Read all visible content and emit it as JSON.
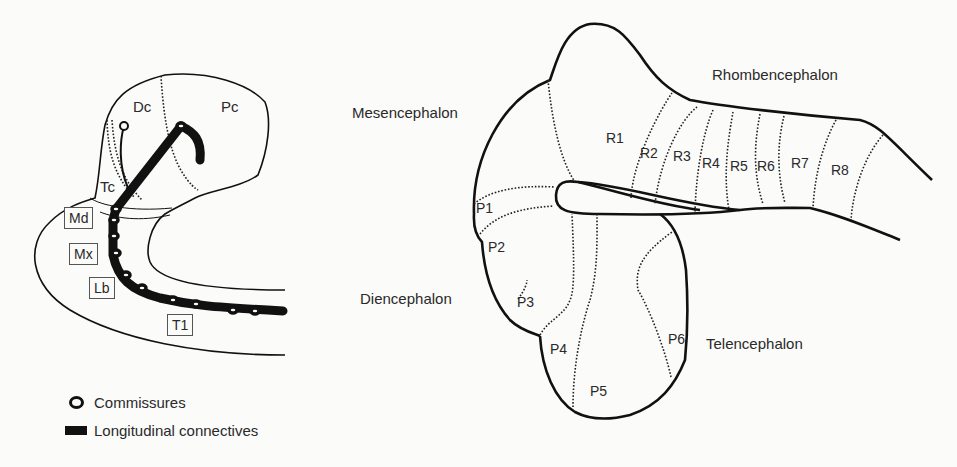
{
  "left_diagram": {
    "regions": {
      "dc": "Dc",
      "pc": "Pc",
      "tc": "Tc"
    },
    "segments": {
      "md": "Md",
      "mx": "Mx",
      "lb": "Lb",
      "t1": "T1"
    }
  },
  "legend": {
    "commissures": "Commissures",
    "longitudinal": "Longitudinal connectives"
  },
  "right_diagram": {
    "regions": {
      "mesencephalon": "Mesencephalon",
      "rhombencephalon": "Rhombencephalon",
      "diencephalon": "Diencephalon",
      "telencephalon": "Telencephalon"
    },
    "rhombomeres": [
      "R1",
      "R2",
      "R3",
      "R4",
      "R5",
      "R6",
      "R7",
      "R8"
    ],
    "prosomeres": [
      "P1",
      "P2",
      "P3",
      "P4",
      "P5",
      "P6"
    ]
  },
  "colors": {
    "ink": "#111111",
    "background": "#fbfbfa",
    "text": "#2a2a2a"
  }
}
